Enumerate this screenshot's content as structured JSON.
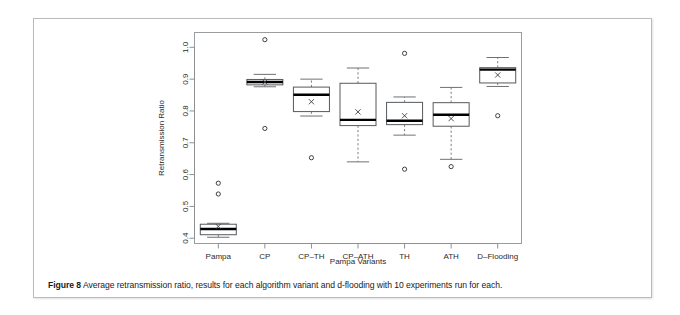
{
  "caption": {
    "label": "Figure 8",
    "text": "Average retransmission ratio, results for each algorithm variant and d-flooding with 10 experiments run for each."
  },
  "chart_data": {
    "type": "box",
    "title": "",
    "xlabel": "Pampa Variants",
    "ylabel": "Retransmission Ratio",
    "ylim": [
      0.385,
      1.045
    ],
    "yticks": [
      0.4,
      0.5,
      0.6,
      0.7,
      0.8,
      0.9,
      1.0
    ],
    "ytick_labels": [
      "0.4",
      "0.5",
      "0.6",
      "0.7",
      "0.8",
      "0.9",
      "1.0"
    ],
    "grid": false,
    "legend": "none",
    "categories": [
      "Pampa",
      "CP",
      "CP–TH",
      "CP–ATH",
      "TH",
      "ATH",
      "D–Flooding"
    ],
    "boxes": [
      {
        "name": "Pampa",
        "whisker_low": 0.403,
        "q1": 0.411,
        "median": 0.429,
        "q3": 0.444,
        "whisker_high": 0.447,
        "mean": 0.437,
        "outliers": [
          0.539,
          0.573
        ]
      },
      {
        "name": "CP",
        "whisker_low": 0.876,
        "q1": 0.882,
        "median": 0.891,
        "q3": 0.899,
        "whisker_high": 0.915,
        "mean": 0.891,
        "outliers": [
          0.745,
          1.024
        ]
      },
      {
        "name": "CP–TH",
        "whisker_low": 0.784,
        "q1": 0.798,
        "median": 0.851,
        "q3": 0.875,
        "whisker_high": 0.9,
        "mean": 0.829,
        "outliers": [
          0.653
        ]
      },
      {
        "name": "CP–ATH",
        "whisker_low": 0.64,
        "q1": 0.754,
        "median": 0.772,
        "q3": 0.887,
        "whisker_high": 0.935,
        "mean": 0.797,
        "outliers": []
      },
      {
        "name": "TH",
        "whisker_low": 0.724,
        "q1": 0.757,
        "median": 0.769,
        "q3": 0.827,
        "whisker_high": 0.844,
        "mean": 0.785,
        "outliers": [
          0.617,
          0.981
        ]
      },
      {
        "name": "ATH",
        "whisker_low": 0.648,
        "q1": 0.752,
        "median": 0.788,
        "q3": 0.826,
        "whisker_high": 0.874,
        "mean": 0.776,
        "outliers": [
          0.625
        ]
      },
      {
        "name": "D–Flooding",
        "whisker_low": 0.877,
        "q1": 0.888,
        "median": 0.93,
        "q3": 0.936,
        "whisker_high": 0.968,
        "mean": 0.913,
        "outliers": [
          0.785
        ]
      }
    ]
  },
  "colors": {
    "box_stroke": "#56595c",
    "median": "#000000",
    "whisker": "#7b7e81",
    "outlier": "#3d4043",
    "frame": "#9a9da0",
    "text": "#2b2b2b"
  }
}
